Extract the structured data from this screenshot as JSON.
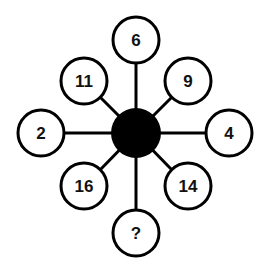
{
  "diagram": {
    "center": {
      "x": 136,
      "y": 133,
      "r": 25,
      "fill": "#000000"
    },
    "nodes": [
      {
        "id": "top",
        "label": "6",
        "x": 136,
        "y": 40
      },
      {
        "id": "top-right",
        "label": "9",
        "x": 188,
        "y": 81
      },
      {
        "id": "right",
        "label": "4",
        "x": 229,
        "y": 133
      },
      {
        "id": "bottom-right",
        "label": "14",
        "x": 188,
        "y": 186
      },
      {
        "id": "bottom",
        "label": "?",
        "x": 136,
        "y": 233
      },
      {
        "id": "bottom-left",
        "label": "16",
        "x": 84,
        "y": 186
      },
      {
        "id": "left",
        "label": "2",
        "x": 41,
        "y": 133
      },
      {
        "id": "top-left",
        "label": "11",
        "x": 84,
        "y": 81
      }
    ],
    "node_radius": 23,
    "stroke_color": "#000000"
  }
}
